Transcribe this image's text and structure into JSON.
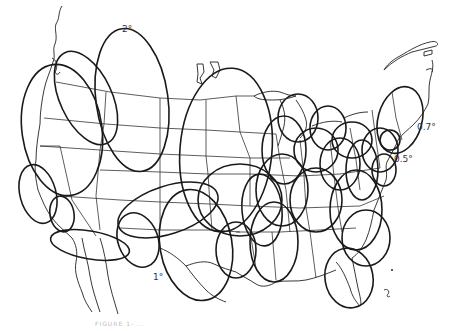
{
  "figure": {
    "labels": [
      {
        "id": "west",
        "text": "2°",
        "x": 122,
        "y": 7
      },
      {
        "id": "northeast",
        "text": "0.7°",
        "x": 417,
        "y": 119
      },
      {
        "id": "east-coast",
        "text": "0.5°",
        "x": 394,
        "y": 151
      },
      {
        "id": "southwest",
        "text": "1°",
        "x": 153,
        "y": 270
      }
    ],
    "caption": "FIGURE 1-  ...",
    "colors": {
      "background": "#ffffff",
      "ellipse_stroke": "#1a1a1a",
      "border_stroke": "#333333"
    }
  }
}
